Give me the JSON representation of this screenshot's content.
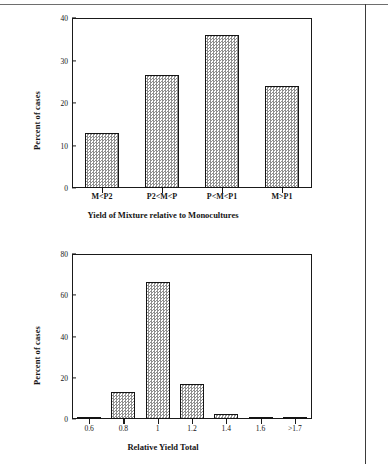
{
  "page": {
    "background_color": "#ffffff",
    "ink_color": "#151515",
    "bar_fill": "#8f8f8f",
    "bar_outline": "#141414"
  },
  "chart_data": [
    {
      "id": "top",
      "type": "bar",
      "title": "",
      "xlabel": "Yield of Mixture relative to Monocultures",
      "ylabel": "Percent of cases",
      "categories": [
        "M<P2",
        "P2<M<P",
        "P<M<P1",
        "M>P1"
      ],
      "values": [
        13,
        26.5,
        36,
        24
      ],
      "ylim": [
        0,
        40
      ],
      "yticks": [
        0,
        10,
        20,
        30,
        40
      ],
      "ytick_labels": [
        "0",
        "10",
        "20",
        "30",
        "40"
      ],
      "grid": false,
      "legend": "none"
    },
    {
      "id": "bottom",
      "type": "bar",
      "title": "",
      "xlabel": "Relative Yield Total",
      "ylabel": "Percent of cases",
      "categories": [
        "0.6",
        "0.8",
        "1",
        "1.2",
        "1.4",
        "1.6",
        ">1.7"
      ],
      "values": [
        1,
        13,
        66.5,
        17,
        2.5,
        1,
        0.4
      ],
      "ylim": [
        0,
        80
      ],
      "yticks": [
        0,
        20,
        40,
        60,
        80
      ],
      "ytick_labels": [
        "0",
        "20",
        "40",
        "60",
        "80"
      ],
      "grid": false,
      "legend": "none"
    }
  ]
}
